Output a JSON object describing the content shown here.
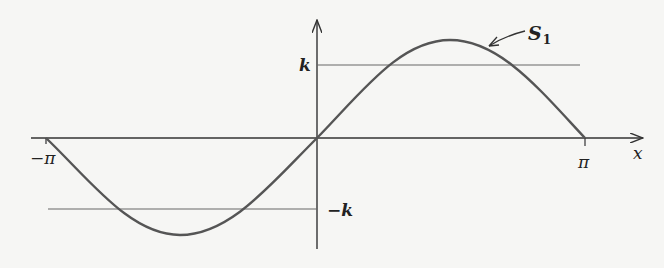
{
  "diagram": {
    "curve_label": "S",
    "curve_label_subscript": "1",
    "axis_x_label": "x",
    "tick_neg_pi": "−π",
    "tick_pi": "π",
    "level_k": "k",
    "level_neg_k": "−k",
    "colors": {
      "curve": "#555555",
      "axis": "#333333",
      "level_lines": "#666666",
      "background": "#f6f6f4"
    }
  }
}
